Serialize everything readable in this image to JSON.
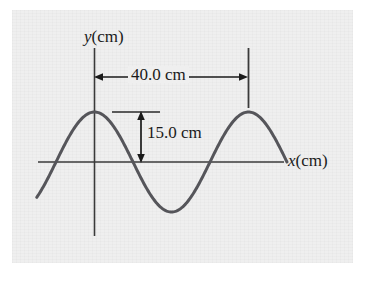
{
  "figure": {
    "kind": "wave-diagram",
    "background_color": "#efefef",
    "page_color": "#ffffff",
    "ink_color": "#55555a",
    "text_color": "#1a1a1a",
    "axis": {
      "y_label_var": "y",
      "y_label_unit": "(cm)",
      "x_label_var": "x",
      "x_label_unit": "(cm)"
    },
    "annotations": {
      "wavelength_label": "40.0 cm",
      "amplitude_label": "15.0 cm"
    }
  },
  "chart_data": {
    "type": "line",
    "title": "",
    "xlabel": "x(cm)",
    "ylabel": "y(cm)",
    "grid": false,
    "legend": null,
    "xlim": [
      -10,
      50
    ],
    "ylim": [
      -15,
      15
    ],
    "annotations": [
      {
        "text": "40.0 cm",
        "kind": "double-arrow-horizontal",
        "meaning": "wavelength",
        "value": 40.0,
        "unit": "cm",
        "from_x": 0.0,
        "to_x": 40.0
      },
      {
        "text": "15.0 cm",
        "kind": "double-arrow-vertical",
        "meaning": "amplitude",
        "value": 15.0,
        "unit": "cm",
        "from_y": 0.0,
        "to_y": 15.0
      }
    ],
    "series": [
      {
        "name": "y(x)",
        "equation": "y = 15.0 cos(2*pi*x/40.0)",
        "amplitude": 15.0,
        "wavelength": 40.0,
        "x": [
          -15.0,
          -12.5,
          -10.0,
          -7.5,
          -5.0,
          -2.5,
          0.0,
          2.5,
          5.0,
          7.5,
          10.0,
          12.5,
          15.0,
          17.5,
          20.0,
          22.5,
          25.0,
          27.5,
          30.0,
          32.5,
          35.0,
          37.5,
          40.0,
          42.5,
          45.0,
          47.5,
          49.0
        ],
        "values": [
          -10.6,
          -14.0,
          -15.0,
          -13.9,
          -10.6,
          -5.7,
          15.0,
          13.9,
          10.6,
          5.7,
          0.0,
          -5.7,
          -10.6,
          -13.9,
          -15.0,
          -13.9,
          -10.6,
          -5.7,
          0.0,
          5.7,
          10.6,
          13.9,
          15.0,
          13.9,
          10.6,
          5.7,
          3.0
        ]
      }
    ]
  }
}
